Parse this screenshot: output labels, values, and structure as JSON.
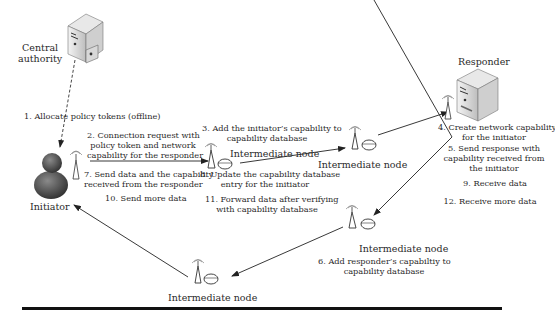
{
  "figure": {
    "type": "network-capability-protocol-diagram",
    "entities": {
      "central_authority": {
        "label_line1": "Central",
        "label_line2": "authority",
        "icon": "server-icon"
      },
      "responder": {
        "label": "Responder",
        "icon": "server-icon"
      },
      "initiator": {
        "label": "Initiator",
        "icon": "user-icon"
      },
      "node_a": {
        "label": "Intermediate node",
        "icon": "router-and-database-icon"
      },
      "node_b": {
        "label": "Intermediate node",
        "icon": "router-and-database-icon"
      },
      "node_c": {
        "label": "Intermediate node",
        "icon": "router-and-database-icon"
      },
      "node_d": {
        "label": "Intermediate node",
        "icon": "router-and-database-icon"
      }
    },
    "steps": {
      "s1": "1. Allocate policy tokens (offline)",
      "s2": [
        "2. Connection request with",
        "policy token and network",
        "capability for the responder"
      ],
      "s3": [
        "3. Add the initiator’s capability to",
        "capability database"
      ],
      "s4": [
        "4. Create network capability",
        "for the initiator"
      ],
      "s5": [
        "5. Send response with",
        "capability received from",
        "the initiator"
      ],
      "s6": [
        "6. Add responder’s capabiltiy to",
        "capability database"
      ],
      "s7": [
        "7. Send data and the capability",
        "received from the responder"
      ],
      "s8": [
        "8. Update the capability database",
        "entry for the initiator"
      ],
      "s9": "9. Receive data",
      "s10": "10. Send more data",
      "s11": [
        "11. Forward data after verifying",
        "with capability database"
      ],
      "s12": "12. Receive more data"
    },
    "colors": {
      "ink": "#2a2a2a",
      "rule": "#111111",
      "background": "#ffffff"
    }
  }
}
